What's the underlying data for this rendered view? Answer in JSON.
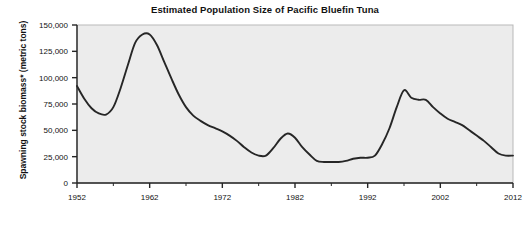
{
  "chart_data": {
    "type": "line",
    "title": "Estimated Population Size of Pacific Bluefin Tuna",
    "xlabel": "",
    "ylabel": "Spawning stock biomass* (metric tons)",
    "xlim": [
      1952,
      2012
    ],
    "ylim": [
      0,
      150000
    ],
    "grid": false,
    "legend": "none",
    "y_ticks": [
      0,
      25000,
      50000,
      75000,
      100000,
      125000,
      150000
    ],
    "y_tick_labels": [
      "0",
      "25,000",
      "50,000",
      "75,000",
      "100,000",
      "125,000",
      "150,000"
    ],
    "x_ticks": [
      1952,
      1962,
      1972,
      1982,
      1992,
      2002,
      2012
    ],
    "x_tick_labels": [
      "1952",
      "1962",
      "1972",
      "1982",
      "1992",
      "2002",
      "2012"
    ],
    "x_minor_ticks": [
      1957,
      1967,
      1977,
      1987,
      1997,
      2007
    ],
    "series": [
      {
        "name": "Spawning stock biomass",
        "color": "#262626",
        "x": [
          1952,
          1953,
          1954,
          1955,
          1956,
          1957,
          1958,
          1959,
          1960,
          1961,
          1962,
          1963,
          1964,
          1965,
          1966,
          1967,
          1968,
          1969,
          1970,
          1971,
          1972,
          1973,
          1974,
          1975,
          1976,
          1977,
          1978,
          1979,
          1980,
          1981,
          1982,
          1983,
          1984,
          1985,
          1986,
          1987,
          1988,
          1989,
          1990,
          1991,
          1992,
          1993,
          1994,
          1995,
          1996,
          1997,
          1998,
          1999,
          2000,
          2001,
          2002,
          2003,
          2004,
          2005,
          2006,
          2007,
          2008,
          2009,
          2010,
          2011,
          2012
        ],
        "values": [
          92000,
          80000,
          71000,
          66000,
          65000,
          72000,
          90000,
          112000,
          133000,
          141000,
          141000,
          131000,
          115000,
          99000,
          84000,
          72000,
          64000,
          59000,
          55000,
          52000,
          49000,
          45000,
          40000,
          34000,
          29000,
          26000,
          26000,
          33000,
          42000,
          47000,
          43000,
          34000,
          27000,
          21000,
          20000,
          20000,
          20000,
          21000,
          23000,
          24000,
          24000,
          26000,
          37000,
          52000,
          72000,
          88000,
          81000,
          79000,
          79000,
          72000,
          66000,
          61000,
          58000,
          55000,
          50000,
          45000,
          40000,
          34000,
          28000,
          26000,
          26000
        ]
      }
    ]
  },
  "footnote": "*"
}
